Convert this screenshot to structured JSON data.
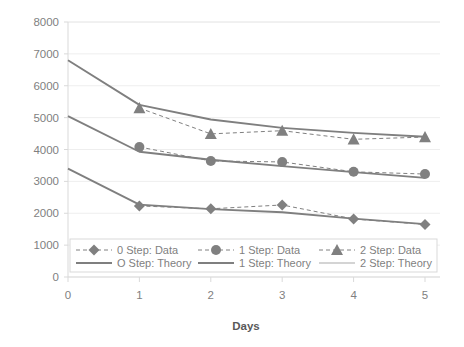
{
  "chart_data": {
    "type": "line",
    "title": "",
    "xlabel": "Days",
    "ylabel": "",
    "xlim": [
      0,
      5
    ],
    "ylim": [
      0,
      8000
    ],
    "x": [
      0,
      1,
      2,
      3,
      4,
      5
    ],
    "xticks": [
      "0",
      "1",
      "2",
      "3",
      "4",
      "5"
    ],
    "yticks": [
      "0",
      "1000",
      "2000",
      "3000",
      "4000",
      "5000",
      "6000",
      "7000",
      "8000"
    ],
    "ytick_values": [
      0,
      1000,
      2000,
      3000,
      4000,
      5000,
      6000,
      7000,
      8000
    ],
    "grid": false,
    "legend_position": "bottom",
    "series": [
      {
        "name": "0 Step: Data",
        "style": "dashed",
        "marker": "diamond",
        "color": "#808080",
        "x": [
          1,
          2,
          3,
          4,
          5
        ],
        "values": [
          2230,
          2140,
          2260,
          1820,
          1650
        ]
      },
      {
        "name": "1 Step: Data",
        "style": "dashed",
        "marker": "circle",
        "color": "#808080",
        "x": [
          1,
          2,
          3,
          4,
          5
        ],
        "values": [
          4080,
          3640,
          3610,
          3300,
          3230
        ]
      },
      {
        "name": "2 Step: Data",
        "style": "dashed",
        "marker": "triangle",
        "color": "#808080",
        "x": [
          1,
          2,
          3,
          4,
          5
        ],
        "values": [
          5300,
          4490,
          4590,
          4320,
          4390
        ]
      },
      {
        "name": "O Step: Theory",
        "style": "solid",
        "marker": "none",
        "color": "#7f7f7f",
        "x": [
          0,
          1,
          2,
          3,
          4,
          5
        ],
        "values": [
          3400,
          2270,
          2130,
          2030,
          1830,
          1660
        ]
      },
      {
        "name": "1 Step: Theory",
        "style": "solid",
        "marker": "none",
        "color": "#7f7f7f",
        "x": [
          0,
          1,
          2,
          3,
          4,
          5
        ],
        "values": [
          5050,
          3930,
          3680,
          3480,
          3290,
          3110
        ]
      },
      {
        "name": "2 Step: Theory",
        "style": "solid",
        "marker": "none",
        "color": "#7f7f7f",
        "x": [
          0,
          1,
          2,
          3,
          4,
          5
        ],
        "values": [
          6800,
          5400,
          4940,
          4680,
          4520,
          4400
        ]
      }
    ],
    "legend": [
      {
        "label": "0 Step: Data",
        "style": "dashed",
        "marker": "diamond",
        "color": "#808080"
      },
      {
        "label": "1 Step: Data",
        "style": "dashed",
        "marker": "circle",
        "color": "#808080"
      },
      {
        "label": "2 Step: Data",
        "style": "dashed",
        "marker": "triangle",
        "color": "#808080"
      },
      {
        "label": "O Step: Theory",
        "style": "solid",
        "marker": "none",
        "color": "#7f7f7f"
      },
      {
        "label": "1 Step: Theory",
        "style": "solid",
        "marker": "none",
        "color": "#7f7f7f"
      },
      {
        "label": "2 Step: Theory",
        "style": "solid",
        "marker": "none",
        "color": "#d4d4d4"
      }
    ]
  }
}
